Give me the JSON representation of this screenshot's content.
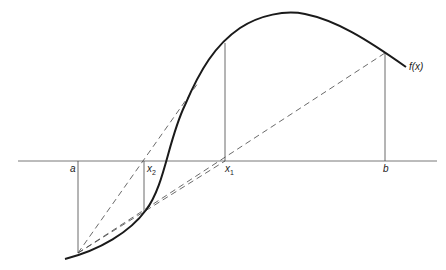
{
  "diagram": {
    "labels": {
      "a": "a",
      "b": "b",
      "x1": "x",
      "x1_sub": "1",
      "x2": "x",
      "x2_sub": "2",
      "fx": "f(x)"
    },
    "colors": {
      "curve": "#1a1a1a",
      "lines": "#444444",
      "background": "#ffffff"
    }
  }
}
